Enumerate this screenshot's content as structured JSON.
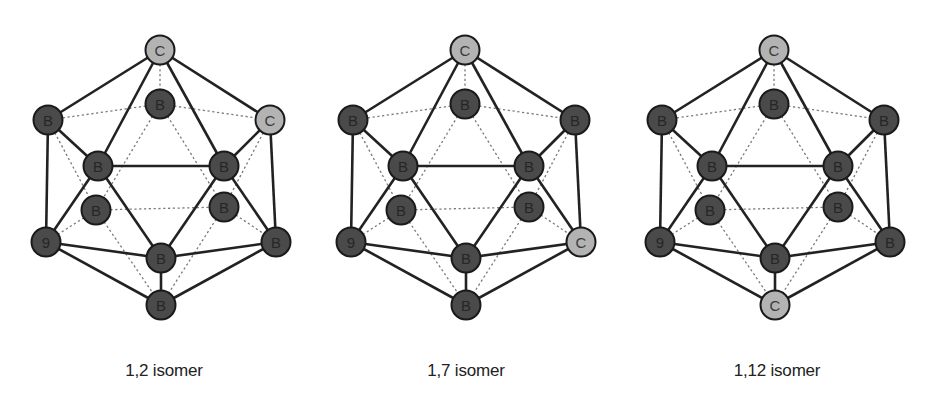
{
  "figure": {
    "colors": {
      "boron_fill": "#4a4a4a",
      "carbon_fill": "#b3b3b3",
      "outline": "#1a1a1a",
      "solid_edge": "#222222",
      "hidden_edge": "#7a7a7a",
      "background": "#ffffff"
    },
    "template_nodes": {
      "top": [
        160,
        50
      ],
      "back_top": [
        160,
        104
      ],
      "left_up": [
        48,
        120
      ],
      "right_up": [
        270,
        120
      ],
      "front_left": [
        98,
        166
      ],
      "front_right": [
        224,
        166
      ],
      "back_left": [
        96,
        210
      ],
      "back_right": [
        224,
        207
      ],
      "left_low": [
        46,
        242
      ],
      "right_low": [
        276,
        242
      ],
      "front_bot": [
        161,
        258
      ],
      "bottom": [
        161,
        305
      ]
    },
    "solid_edges": [
      [
        "top",
        "left_up"
      ],
      [
        "top",
        "right_up"
      ],
      [
        "top",
        "front_left"
      ],
      [
        "top",
        "front_right"
      ],
      [
        "left_up",
        "front_left"
      ],
      [
        "right_up",
        "front_right"
      ],
      [
        "front_left",
        "front_right"
      ],
      [
        "left_up",
        "left_low"
      ],
      [
        "right_up",
        "right_low"
      ],
      [
        "front_left",
        "left_low"
      ],
      [
        "front_left",
        "front_bot"
      ],
      [
        "front_right",
        "front_bot"
      ],
      [
        "front_right",
        "right_low"
      ],
      [
        "left_low",
        "front_bot"
      ],
      [
        "right_low",
        "front_bot"
      ],
      [
        "left_low",
        "bottom"
      ],
      [
        "right_low",
        "bottom"
      ],
      [
        "front_bot",
        "bottom"
      ]
    ],
    "hidden_edges": [
      [
        "top",
        "back_top"
      ],
      [
        "back_top",
        "left_up"
      ],
      [
        "back_top",
        "right_up"
      ],
      [
        "back_top",
        "back_left"
      ],
      [
        "back_top",
        "back_right"
      ],
      [
        "back_left",
        "back_right"
      ],
      [
        "left_up",
        "back_left"
      ],
      [
        "right_up",
        "back_right"
      ],
      [
        "back_left",
        "left_low"
      ],
      [
        "back_right",
        "right_low"
      ],
      [
        "back_left",
        "bottom"
      ],
      [
        "back_right",
        "bottom"
      ]
    ],
    "isomers": [
      {
        "id": "1,2",
        "caption": "1,2 isomer",
        "offset_x": 0,
        "caption_x": 164,
        "atoms": {
          "top": "C",
          "back_top": "B",
          "left_up": "B",
          "right_up": "C",
          "front_left": "B",
          "front_right": "B",
          "back_left": "B",
          "back_right": "B",
          "left_low": "9",
          "right_low": "B",
          "front_bot": "B",
          "bottom": "B"
        }
      },
      {
        "id": "1,7",
        "caption": "1,7 isomer",
        "offset_x": 305,
        "caption_x": 466,
        "atoms": {
          "top": "C",
          "back_top": "B",
          "left_up": "B",
          "right_up": "B",
          "front_left": "B",
          "front_right": "B",
          "back_left": "B",
          "back_right": "B",
          "left_low": "9",
          "right_low": "C",
          "front_bot": "B",
          "bottom": "B"
        }
      },
      {
        "id": "1,12",
        "caption": "1,12 isomer",
        "offset_x": 614,
        "caption_x": 777,
        "atoms": {
          "top": "C",
          "back_top": "B",
          "left_up": "B",
          "right_up": "B",
          "front_left": "B",
          "front_right": "B",
          "back_left": "B",
          "back_right": "B",
          "left_low": "9",
          "right_low": "B",
          "front_bot": "B",
          "bottom": "C"
        }
      }
    ]
  }
}
